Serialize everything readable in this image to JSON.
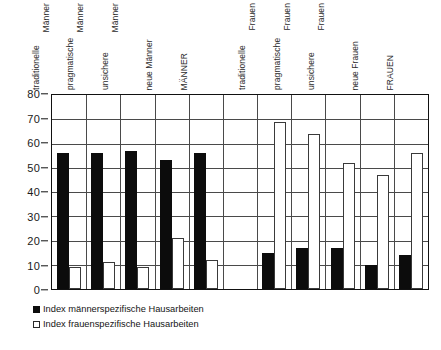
{
  "chart_data": {
    "type": "bar",
    "title": "",
    "xlabel": "",
    "ylabel": "",
    "ylim": [
      0,
      80
    ],
    "yticks": [
      0,
      10,
      20,
      30,
      40,
      50,
      60,
      70,
      80
    ],
    "grid": true,
    "legend_position": "below-left",
    "categories": [
      "traditionelle Männer",
      "pragmatische Männer",
      "unsichere Männer",
      "neue Männer",
      "MÄNNER",
      "",
      "traditionelle Frauen",
      "pragmatische Frauen",
      "unsichere Frauen",
      "neue Frauen",
      "FRAUEN"
    ],
    "category_lines": [
      [
        "traditionelle",
        "Männer"
      ],
      [
        "pragmatische",
        "Männer"
      ],
      [
        "unsichere",
        "Männer"
      ],
      [
        "neue Männer",
        ""
      ],
      [
        "MÄNNER",
        ""
      ],
      [
        "",
        ""
      ],
      [
        "traditionelle",
        "Frauen"
      ],
      [
        "pragmatische",
        "Frauen"
      ],
      [
        "unsichere",
        "Frauen"
      ],
      [
        "neue Frauen",
        ""
      ],
      [
        "FRAUEN",
        ""
      ]
    ],
    "series": [
      {
        "name": "Index männerspezifische Hausarbeiten",
        "color": "#0c0c0c",
        "values": [
          56,
          56,
          57,
          53,
          56,
          null,
          15,
          17,
          17,
          10,
          14
        ]
      },
      {
        "name": "Index frauenspezifische Hausarbeiten",
        "color": "#ffffff",
        "values": [
          9,
          11,
          9,
          21,
          12,
          null,
          69,
          64,
          52,
          47,
          56
        ]
      }
    ]
  },
  "legend": {
    "items": [
      {
        "label": "Index männerspezifische Hausarbeiten",
        "marker": "filled-square"
      },
      {
        "label": "Index frauenspezifische Hausarbeiten",
        "marker": "open-square"
      }
    ]
  }
}
